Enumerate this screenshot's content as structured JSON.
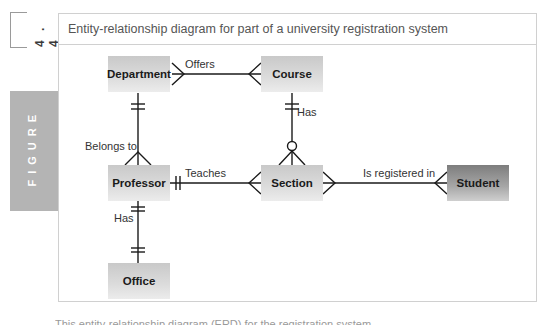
{
  "figure": {
    "number": "4 . 4",
    "tab_label": "FIGURE",
    "title": "Entity-relationship diagram for part of a university registration system"
  },
  "entities": {
    "department": "Department",
    "course": "Course",
    "professor": "Professor",
    "section": "Section",
    "student": "Student",
    "office": "Office"
  },
  "relationships": {
    "offers": "Offers",
    "has_course_section": "Has",
    "belongs_to": "Belongs to",
    "teaches": "Teaches",
    "is_registered_in": "Is registered in",
    "has_professor_office": "Has"
  },
  "body_text_fragment": "This entity-relationship diagram (ERD) for the registration system ..."
}
